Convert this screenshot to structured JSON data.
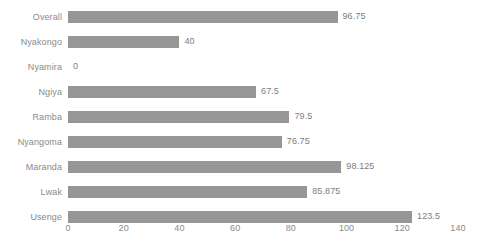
{
  "chart_data": {
    "type": "bar",
    "orientation": "horizontal",
    "title": "",
    "subtitle": "",
    "xlabel": "",
    "ylabel": "",
    "categories": [
      "Overall",
      "Nyakongo",
      "Nyamira",
      "Ngiya",
      "Ramba",
      "Nyangoma",
      "Maranda",
      "Lwak",
      "Usenge"
    ],
    "values": [
      96.75,
      40,
      0,
      67.5,
      79.5,
      76.75,
      98.125,
      85.875,
      123.5
    ],
    "value_labels": [
      "96.75",
      "40",
      "0",
      "67.5",
      "79.5",
      "76.75",
      "98.125",
      "85.875",
      "123.5"
    ],
    "xlim": [
      0,
      140
    ],
    "xticks": [
      0,
      20,
      40,
      60,
      80,
      100,
      120,
      140
    ],
    "xtick_labels": [
      "0",
      "20",
      "40",
      "60",
      "80",
      "100",
      "120",
      "140"
    ],
    "grid": false,
    "legend": null,
    "bar_color": "#969696",
    "label_color": "#8a8a8a",
    "value_color": "#7d7d7d",
    "background": "#ffffff"
  }
}
